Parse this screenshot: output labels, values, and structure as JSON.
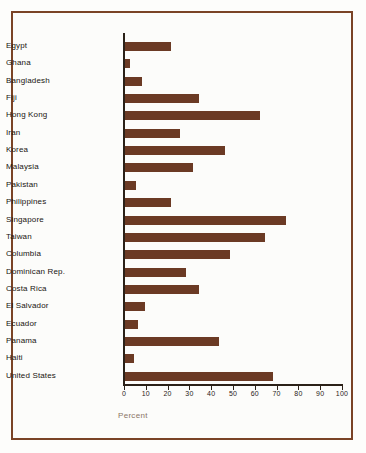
{
  "figure": {
    "frame_color": "#7a4326",
    "background_color": "#fcfcfa",
    "bar_color": "#6b3a24",
    "axis_color": "#2b2118",
    "axis_title_color": "#8a7566"
  },
  "chart_data": {
    "type": "bar",
    "orientation": "horizontal",
    "title": "",
    "xlabel": "Percent",
    "ylabel": "",
    "xlim": [
      0,
      100
    ],
    "xticks": [
      0,
      10,
      20,
      30,
      40,
      50,
      60,
      70,
      80,
      90,
      100
    ],
    "xtick_labels": [
      "0",
      "10",
      "20",
      "30",
      "40",
      "50",
      "60",
      "70",
      "80",
      "90",
      "100"
    ],
    "grid": false,
    "legend": false,
    "categories": [
      "Egypt",
      "Ghana",
      "Bangladesh",
      "Fiji",
      "Hong Kong",
      "Iran",
      "Korea",
      "Malaysia",
      "Pakistan",
      "Philippines",
      "Singapore",
      "Taiwan",
      "Columbia",
      "Dominican Rep.",
      "Costa Rica",
      "El Salvador",
      "Ecuador",
      "Panama",
      "Haiti",
      "United States"
    ],
    "values": [
      21,
      2.5,
      8,
      34,
      62,
      25,
      46,
      31,
      5,
      21,
      74,
      64,
      48,
      28,
      34,
      9,
      6,
      43,
      4,
      68
    ]
  }
}
